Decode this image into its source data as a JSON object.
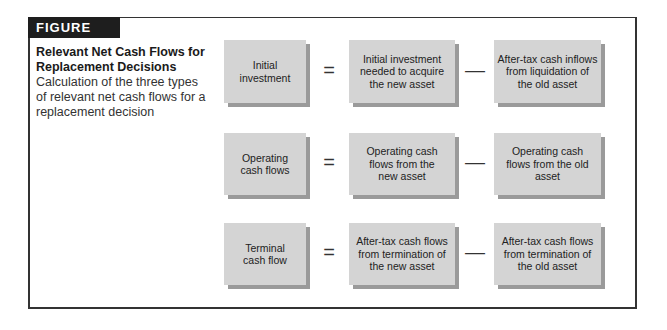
{
  "figure": {
    "label": "FIGURE 11.2",
    "title": "Relevant Net Cash Flows for Replacement Decisions",
    "description": "Calculation of the three types of relevant net cash flows for a replacement decision"
  },
  "rows": [
    {
      "result": "Initial investment",
      "equals": "=",
      "term1": "Initial investment needed to acquire the new asset",
      "minus": "—",
      "term2": "After-tax cash inflows from liquidation of the old asset"
    },
    {
      "result": "Operating cash flows",
      "equals": "=",
      "term1": "Operating cash flows from the new asset",
      "minus": "—",
      "term2": "Operating cash flows from the old asset"
    },
    {
      "result": "Terminal cash flow",
      "equals": "=",
      "term1": "After-tax cash flows from termination of the new asset",
      "minus": "—",
      "term2": "After-tax cash flows from termination of the old asset"
    }
  ],
  "colors": {
    "box_fill": "#d4d4d4",
    "box_shadow": "#9a9a9a",
    "label_bg": "#1e1e1e",
    "frame": "#333333"
  }
}
